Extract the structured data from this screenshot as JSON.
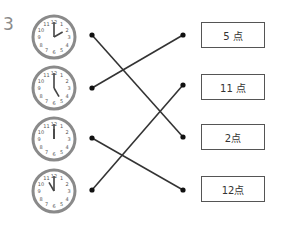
{
  "question_number": "3",
  "clocks": [
    {
      "id": "clock-1",
      "hour": 2,
      "minute": 0
    },
    {
      "id": "clock-2",
      "hour": 5,
      "minute": 0
    },
    {
      "id": "clock-3",
      "hour": 12,
      "minute": 0
    },
    {
      "id": "clock-4",
      "hour": 11,
      "minute": 0
    }
  ],
  "clock_numerals": [
    "12",
    "1",
    "2",
    "3",
    "4",
    "5",
    "6",
    "7",
    "8",
    "9",
    "10",
    "11"
  ],
  "answers": [
    {
      "label": "5 点"
    },
    {
      "label": "11 点"
    },
    {
      "label": "2点"
    },
    {
      "label": "12点"
    }
  ],
  "matches": [
    {
      "clock": 0,
      "answer": 2
    },
    {
      "clock": 1,
      "answer": 0
    },
    {
      "clock": 2,
      "answer": 3
    },
    {
      "clock": 3,
      "answer": 1
    }
  ],
  "colors": {
    "line": "#333333",
    "clock_rim": "#8a8a8a",
    "clock_face": "#ffffff",
    "numerals": "#555555"
  }
}
